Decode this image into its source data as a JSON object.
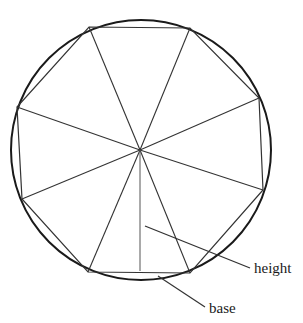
{
  "figure": {
    "circle": {
      "cx": 141,
      "cy": 150,
      "r": 130,
      "stroke": "#1a1a1a",
      "stroke_width": 2
    },
    "center": {
      "x": 140,
      "y": 150
    },
    "polygon_vertices": [
      [
        89,
        27
      ],
      [
        190,
        28
      ],
      [
        259,
        98
      ],
      [
        263,
        190
      ],
      [
        190,
        273
      ],
      [
        88,
        272
      ],
      [
        22,
        199
      ],
      [
        17,
        107
      ]
    ],
    "height_line": {
      "x1": 140,
      "y1": 150,
      "x2": 140,
      "y2": 271
    },
    "labels": {
      "height": "height",
      "base": "base"
    },
    "leaders": {
      "height": {
        "x1": 145,
        "y1": 226,
        "x2": 250,
        "y2": 268
      },
      "base": {
        "x1": 158,
        "y1": 276,
        "x2": 205,
        "y2": 307
      }
    }
  }
}
